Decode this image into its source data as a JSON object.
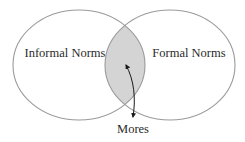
{
  "diagram": {
    "type": "venn",
    "sets": [
      {
        "id": "informal",
        "label": "Informal Norms"
      },
      {
        "id": "formal",
        "label": "Formal Norms"
      }
    ],
    "intersection": {
      "label": "Mores",
      "annotation": "double-headed curved arrow pointing into overlap"
    },
    "colors": {
      "outline": "#9a9a9a",
      "overlap_fill": "#d4d4d4",
      "arrow": "#1a1a1a",
      "text": "#2a2a2a",
      "background": "#ffffff"
    }
  }
}
